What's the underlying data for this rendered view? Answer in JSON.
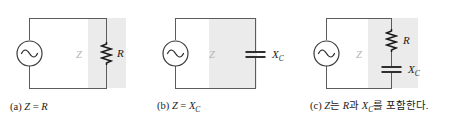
{
  "figure": {
    "title": "",
    "background_color": "#ffffff",
    "wire_color": "#5c5c5c",
    "shade_color": "#ebebeb",
    "label_color": "#1a1a1a",
    "z_marker_color": "#b4b4b4"
  },
  "panels": [
    {
      "id": "a",
      "z_marker": "Z",
      "components": [
        {
          "name": "ac-source",
          "label": ""
        },
        {
          "name": "resistor",
          "label": "R",
          "sub": ""
        }
      ],
      "caption": {
        "tag": "(a)",
        "lhs": "Z",
        "eq": "=",
        "rhs": "R",
        "rhs_sub": "",
        "full": "(a) Z = R"
      }
    },
    {
      "id": "b",
      "z_marker": "Z",
      "components": [
        {
          "name": "ac-source",
          "label": ""
        },
        {
          "name": "capacitor",
          "label": "X",
          "sub": "C"
        }
      ],
      "caption": {
        "tag": "(b)",
        "lhs": "Z",
        "eq": "=",
        "rhs": "X",
        "rhs_sub": "C",
        "full": "(b) Z = X_C"
      }
    },
    {
      "id": "c",
      "z_marker": "Z",
      "components": [
        {
          "name": "ac-source",
          "label": ""
        },
        {
          "name": "resistor",
          "label": "R",
          "sub": ""
        },
        {
          "name": "capacitor",
          "label": "X",
          "sub": "C"
        }
      ],
      "caption": {
        "tag": "(c)",
        "part1": "Z",
        "part2": "는 ",
        "part3": "R",
        "part4": "과 ",
        "part5": "X",
        "part5_sub": "C",
        "part6": "를 포함한다.",
        "full": "(c) Z는 R과 X_C를 포함한다."
      }
    }
  ]
}
